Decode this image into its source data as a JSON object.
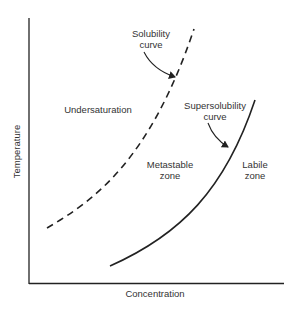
{
  "diagram": {
    "axes": {
      "xlabel": "Concentration",
      "ylabel": "Temperature"
    },
    "curves": [
      {
        "name": "Solubility curve",
        "style": "dashed"
      },
      {
        "name": "Supersolubility curve",
        "style": "solid"
      }
    ],
    "labels": {
      "solubility_line1": "Solubility",
      "solubility_line2": "curve",
      "supersolubility_line1": "Supersolubility",
      "supersolubility_line2": "curve",
      "undersaturation": "Undersaturation",
      "metastable_line1": "Metastable",
      "metastable_line2": "zone",
      "labile_line1": "Labile",
      "labile_line2": "zone"
    }
  }
}
